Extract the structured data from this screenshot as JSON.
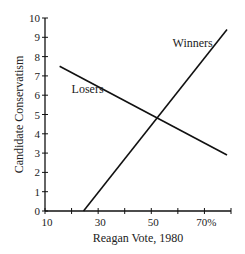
{
  "chart_data": {
    "type": "line",
    "title": "",
    "xlabel": "Reagan Vote, 1980",
    "ylabel": "Candidate Conservatism",
    "xlim": [
      10,
      80
    ],
    "ylim": [
      0,
      10
    ],
    "x_tick_labels": [
      "10",
      "30",
      "50",
      "70%"
    ],
    "x_tick_values": [
      10,
      30,
      50,
      70
    ],
    "x_minor_ticks": [
      20,
      40,
      60,
      80
    ],
    "y_tick_labels": [
      "0",
      "1",
      "2",
      "3",
      "4",
      "5",
      "6",
      "7",
      "8",
      "9",
      "10"
    ],
    "grid": false,
    "legend": "inline labels",
    "series": [
      {
        "name": "Winners",
        "x": [
          24.5,
          78.5
        ],
        "y": [
          0,
          9.4
        ]
      },
      {
        "name": "Losers",
        "x": [
          15.5,
          78.5
        ],
        "y": [
          7.5,
          2.9
        ]
      }
    ],
    "annotations": [
      {
        "text": "Winners",
        "x": 58,
        "y": 8.5
      },
      {
        "text": "Losers",
        "x": 20,
        "y": 6.1
      }
    ]
  },
  "labels": {
    "xlabel": "Reagan Vote, 1980",
    "ylabel": "Candidate Conservatism",
    "winners": "Winners",
    "losers": "Losers"
  }
}
